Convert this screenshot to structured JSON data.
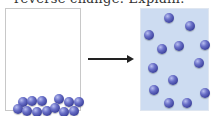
{
  "caption": "reverse change. Explain.",
  "diagram": {
    "left_container": {
      "fill": "#ffffff",
      "particles": [
        [
          12,
          88
        ],
        [
          21,
          87
        ],
        [
          31,
          87
        ],
        [
          48,
          85
        ],
        [
          58,
          88
        ],
        [
          68,
          88
        ],
        [
          7,
          95
        ],
        [
          16,
          97
        ],
        [
          26,
          98
        ],
        [
          36,
          97
        ],
        [
          44,
          94
        ],
        [
          53,
          98
        ],
        [
          63,
          97
        ]
      ]
    },
    "arrow": {
      "direction": "right",
      "color": "#222222"
    },
    "right_container": {
      "fill": "#cddcf1",
      "particles": [
        [
          23,
          4
        ],
        [
          44,
          12
        ],
        [
          3,
          21
        ],
        [
          16,
          35
        ],
        [
          33,
          32
        ],
        [
          59,
          31
        ],
        [
          7,
          54
        ],
        [
          53,
          49
        ],
        [
          27,
          66
        ],
        [
          8,
          76
        ],
        [
          59,
          79
        ],
        [
          23,
          89
        ],
        [
          41,
          89
        ]
      ]
    },
    "particle_color": "#4a50b0"
  }
}
